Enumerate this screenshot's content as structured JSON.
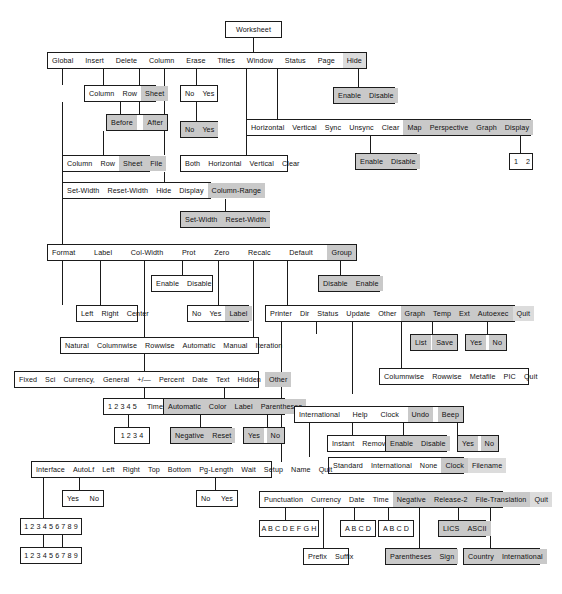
{
  "colors": {
    "highlight": "#c9c9c9",
    "highlight_light": "#dcdcdc",
    "border": "#222222",
    "background": "#ffffff",
    "text": "#111111"
  },
  "nodes": {
    "root": {
      "items": [
        "Worksheet"
      ]
    },
    "main_menu": {
      "items": [
        "Global",
        "Insert",
        "Delete",
        "Column",
        "Erase",
        "Titles",
        "Window",
        "Status",
        "Page",
        "Hide"
      ]
    },
    "insert_type": {
      "items": [
        "Column",
        "Row",
        "Sheet"
      ]
    },
    "insert_before_after": {
      "items": [
        "Before",
        "After"
      ]
    },
    "delete_type": {
      "items": [
        "Column",
        "Row",
        "Sheet",
        "File"
      ]
    },
    "erase_yes_no_1": {
      "items": [
        "No",
        "Yes"
      ]
    },
    "erase_yes_no_2": {
      "items": [
        "No",
        "Yes"
      ]
    },
    "titles": {
      "items": [
        "Both",
        "Horizontal",
        "Vertical",
        "Clear"
      ]
    },
    "window": {
      "items": [
        "Horizontal",
        "Vertical",
        "Sync",
        "Unsync",
        "Clear",
        "Map",
        "Perspective",
        "Graph",
        "Display"
      ]
    },
    "window_map_enable": {
      "items": [
        "Enable",
        "Disable"
      ]
    },
    "window_graph_enable": {
      "items": [
        "Enable",
        "Disable"
      ]
    },
    "window_display": {
      "items": [
        "1",
        "2"
      ]
    },
    "hide_enable": {
      "items": [
        "Enable",
        "Disable"
      ]
    },
    "column": {
      "items": [
        "Set-Width",
        "Reset-Width",
        "Hide",
        "Display",
        "Column-Range"
      ]
    },
    "column_range": {
      "items": [
        "Set-Width",
        "Reset-Width"
      ]
    },
    "global_menu": {
      "items": [
        "Format",
        "Label",
        "Col-Width",
        "Prot",
        "Zero",
        "Recalc",
        "Default",
        "Group"
      ]
    },
    "prot_enable": {
      "items": [
        "Enable",
        "Disable"
      ]
    },
    "group_disable": {
      "items": [
        "Disable",
        "Enable"
      ]
    },
    "label_align": {
      "items": [
        "Left",
        "Right",
        "Center"
      ]
    },
    "zero": {
      "items": [
        "No",
        "Yes",
        "Label"
      ]
    },
    "recalc": {
      "items": [
        "Natural",
        "Columnwise",
        "Rowwise",
        "Automatic",
        "Manual",
        "Iteration"
      ]
    },
    "default_menu": {
      "items": [
        "Printer",
        "Dir",
        "Status",
        "Update",
        "Other",
        "Graph",
        "Temp",
        "Ext",
        "Autoexec",
        "Quit"
      ]
    },
    "default_graph": {
      "items": [
        "List",
        "Save"
      ]
    },
    "default_autoexec": {
      "items": [
        "Yes",
        "No"
      ]
    },
    "graph_types": {
      "items": [
        "Columnwise",
        "Rowwise",
        "Metafile",
        "PIC",
        "Quit"
      ]
    },
    "format_menu": {
      "items": [
        "Fixed",
        "Sci",
        "Currency,",
        "General",
        "+/—",
        "Percent",
        "Date",
        "Text",
        "Hidden",
        "Other"
      ]
    },
    "format_decimals": {
      "items": [
        "1 2 3 4 5",
        "Time"
      ]
    },
    "format_time_sub": {
      "items": [
        "1 2 3 4"
      ]
    },
    "other_menu": {
      "items": [
        "Automatic",
        "Color",
        "Label",
        "Parentheses"
      ]
    },
    "other_color": {
      "items": [
        "Negative",
        "Reset"
      ]
    },
    "other_parens": {
      "items": [
        "Yes",
        "No"
      ]
    },
    "default_other": {
      "items": [
        "International",
        "Help",
        "Clock",
        "Undo",
        "Beep"
      ]
    },
    "help_mode": {
      "items": [
        "Instant",
        "Removable"
      ]
    },
    "undo_enable": {
      "items": [
        "Enable",
        "Disable"
      ]
    },
    "beep_yes_no": {
      "items": [
        "Yes",
        "No"
      ]
    },
    "clock_menu": {
      "items": [
        "Standard",
        "International",
        "None",
        "Clock",
        "Filename"
      ]
    },
    "printer_menu": {
      "items": [
        "Interface",
        "AutoLf",
        "Left",
        "Right",
        "Top",
        "Bottom",
        "Pg-Length",
        "Wait",
        "Setup",
        "Name",
        "Quit"
      ]
    },
    "printer_autolf": {
      "items": [
        "Yes",
        "No"
      ]
    },
    "printer_wait": {
      "items": [
        "No",
        "Yes"
      ]
    },
    "interface_list_1": {
      "items": [
        "1 2 3 4 5 6 7 8 9"
      ]
    },
    "interface_list_2": {
      "items": [
        "1 2 3 4 5 6 7 8 9"
      ]
    },
    "international_menu": {
      "items": [
        "Punctuation",
        "Currency",
        "Date",
        "Time",
        "Negative",
        "Release-2",
        "File-Translation",
        "Quit"
      ]
    },
    "intl_punctuation": {
      "items": [
        "A B C D E F G H"
      ]
    },
    "intl_currency_prefix": {
      "items": [
        "Prefix",
        "Suffix"
      ]
    },
    "intl_date": {
      "items": [
        "A B C D"
      ]
    },
    "intl_time": {
      "items": [
        "A B C D"
      ]
    },
    "intl_negative": {
      "items": [
        "Parentheses",
        "Sign"
      ]
    },
    "intl_release2": {
      "items": [
        "LICS",
        "ASCII"
      ]
    },
    "intl_filetrans": {
      "items": [
        "Country",
        "International"
      ]
    }
  }
}
